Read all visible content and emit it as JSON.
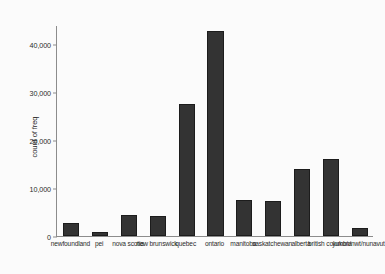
{
  "chart_data": {
    "type": "bar",
    "title": "",
    "xlabel": "",
    "ylabel": "count of freq",
    "ylim": [
      0,
      44000
    ],
    "grid": false,
    "legend": false,
    "ytick_labels": [
      "0",
      "10,000",
      "20,000",
      "30,000",
      "40,000"
    ],
    "ytick_values": [
      0,
      10000,
      20000,
      30000,
      40000
    ],
    "categories": [
      "newfoundland",
      "pei",
      "nova scotia",
      "new brunswick",
      "quebec",
      "ontario",
      "manitoba",
      "saskatchewan",
      "alberta",
      "british columbia",
      "yukon/nwt/nunavut"
    ],
    "values": [
      2700,
      800,
      4300,
      4200,
      27500,
      42800,
      7500,
      7300,
      14000,
      16100,
      1700
    ],
    "bar_color": "#333333",
    "axis_color": "#8c8c8c"
  }
}
